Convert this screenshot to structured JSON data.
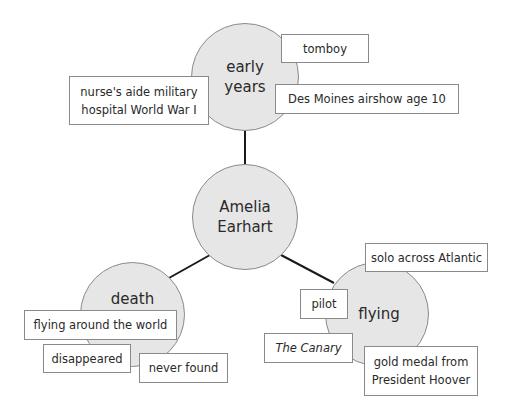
{
  "diagram": {
    "type": "concept-map",
    "colors": {
      "node_fill": "#e6e6e6",
      "node_border": "#8a8a8a",
      "box_fill": "#ffffff",
      "box_border": "#8a8a8a",
      "connector": "#1a1a1a"
    },
    "center": {
      "label": "Amelia\nEarhart"
    },
    "branches": [
      {
        "id": "early-years",
        "label": "early\nyears",
        "details": [
          {
            "text": "tomboy"
          },
          {
            "text": "nurse's aide military\nhospital World War I"
          },
          {
            "text": "Des Moines airshow age 10"
          }
        ]
      },
      {
        "id": "death",
        "label": "death",
        "details": [
          {
            "text": "flying around the world"
          },
          {
            "text": "disappeared"
          },
          {
            "text": "never found"
          }
        ]
      },
      {
        "id": "flying",
        "label": "flying",
        "details": [
          {
            "text": "solo across Atlantic"
          },
          {
            "text": "pilot"
          },
          {
            "text": "The Canary"
          },
          {
            "text": "gold medal from\nPresident Hoover"
          }
        ]
      }
    ]
  }
}
